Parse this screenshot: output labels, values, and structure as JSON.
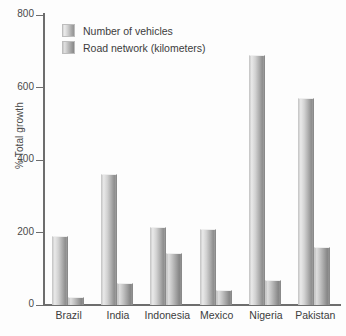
{
  "chart_data": {
    "type": "bar",
    "title": "",
    "xlabel": "",
    "ylabel": "% Total growth",
    "ylim": [
      0,
      800
    ],
    "yticks": [
      0,
      200,
      400,
      600,
      800
    ],
    "ytick_labels": [
      "0",
      "200",
      "400",
      "600",
      "800"
    ],
    "grid": false,
    "legend_position": "top-left",
    "categories": [
      "Brazil",
      "India",
      "Indonesia",
      "Mexico",
      "Nigeria",
      "Pakistan"
    ],
    "series": [
      {
        "name": "Number of vehicles",
        "values": [
          190,
          362,
          215,
          210,
          690,
          572
        ]
      },
      {
        "name": "Road network (kilometers)",
        "values": [
          23,
          62,
          143,
          42,
          69,
          160
        ]
      }
    ]
  },
  "axis": {
    "y_title": "% Total growth"
  }
}
